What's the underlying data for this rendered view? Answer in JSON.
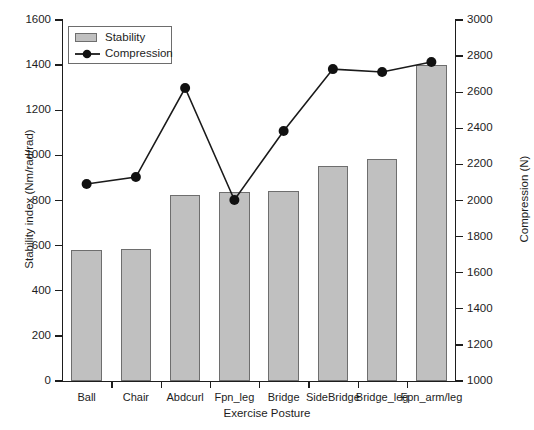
{
  "chart_data": {
    "type": "bar",
    "title": "",
    "subtitle": "",
    "xlabel": "Exercise Posture",
    "ylabel": "Stability index (Nm/rad/rad)",
    "ylabel_right": "Compression (N)",
    "categories": [
      "Ball",
      "Chair",
      "Abdcurl",
      "Fpn_leg",
      "Bridge",
      "SideBridge",
      "Bridge_leg",
      "Fpn_arm/leg"
    ],
    "ylim": [
      0,
      1600
    ],
    "yticks": [
      0,
      200,
      400,
      600,
      800,
      1000,
      1200,
      1400,
      1600
    ],
    "ylim_right": [
      1000,
      3000
    ],
    "yticks_right": [
      1000,
      1200,
      1400,
      1600,
      1800,
      2000,
      2200,
      2400,
      2600,
      2800,
      3000
    ],
    "grid": false,
    "legend_position": "top-left",
    "series": [
      {
        "name": "Stability",
        "kind": "bar",
        "axis": "left",
        "color": "#c0c0c0",
        "edge_color": "#6e6e6e",
        "values": [
          581,
          587,
          824,
          838,
          843,
          952,
          982,
          1400
        ]
      },
      {
        "name": "Compression",
        "kind": "line",
        "axis": "right",
        "color": "#1a1a1a",
        "marker": "circle",
        "values": [
          2091,
          2130,
          2623,
          2003,
          2385,
          2728,
          2712,
          2767
        ]
      }
    ]
  },
  "legend": {
    "items": [
      {
        "label": "Stability",
        "type": "swatch"
      },
      {
        "label": "Compression",
        "type": "line-marker"
      }
    ]
  },
  "axes": {
    "left_label": "Stability index (Nm/rad/rad)",
    "right_label": "Compression (N)",
    "bottom_label": "Exercise Posture"
  }
}
